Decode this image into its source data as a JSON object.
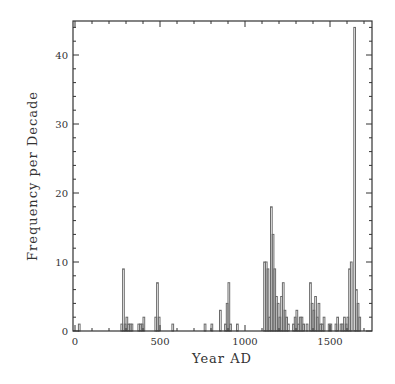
{
  "chart_data": {
    "type": "bar",
    "style": "step-histogram",
    "title": "",
    "xlabel": "Year AD",
    "ylabel": "Frequency per Decade",
    "xlim": [
      0,
      1700
    ],
    "ylim": [
      0,
      45
    ],
    "x_ticks": [
      0,
      500,
      1000,
      1500
    ],
    "y_ticks": [
      0,
      10,
      20,
      30,
      40
    ],
    "grid": false,
    "legend": null,
    "bin_width": 10,
    "bins": [
      {
        "x": 20,
        "y": 1
      },
      {
        "x": 270,
        "y": 1
      },
      {
        "x": 280,
        "y": 9
      },
      {
        "x": 290,
        "y": 1
      },
      {
        "x": 300,
        "y": 2
      },
      {
        "x": 310,
        "y": 1
      },
      {
        "x": 320,
        "y": 1
      },
      {
        "x": 330,
        "y": 1
      },
      {
        "x": 370,
        "y": 1
      },
      {
        "x": 380,
        "y": 1
      },
      {
        "x": 390,
        "y": 1
      },
      {
        "x": 400,
        "y": 2
      },
      {
        "x": 470,
        "y": 2
      },
      {
        "x": 480,
        "y": 7
      },
      {
        "x": 490,
        "y": 2
      },
      {
        "x": 570,
        "y": 1
      },
      {
        "x": 760,
        "y": 1
      },
      {
        "x": 800,
        "y": 1
      },
      {
        "x": 850,
        "y": 3
      },
      {
        "x": 880,
        "y": 1
      },
      {
        "x": 890,
        "y": 4
      },
      {
        "x": 900,
        "y": 7
      },
      {
        "x": 910,
        "y": 1
      },
      {
        "x": 950,
        "y": 1
      },
      {
        "x": 1110,
        "y": 10
      },
      {
        "x": 1120,
        "y": 10
      },
      {
        "x": 1130,
        "y": 9
      },
      {
        "x": 1140,
        "y": 2
      },
      {
        "x": 1150,
        "y": 18
      },
      {
        "x": 1160,
        "y": 14
      },
      {
        "x": 1170,
        "y": 9
      },
      {
        "x": 1180,
        "y": 5
      },
      {
        "x": 1190,
        "y": 4
      },
      {
        "x": 1200,
        "y": 2
      },
      {
        "x": 1210,
        "y": 5
      },
      {
        "x": 1220,
        "y": 7
      },
      {
        "x": 1230,
        "y": 3
      },
      {
        "x": 1240,
        "y": 2
      },
      {
        "x": 1250,
        "y": 1
      },
      {
        "x": 1280,
        "y": 1
      },
      {
        "x": 1290,
        "y": 2
      },
      {
        "x": 1300,
        "y": 3
      },
      {
        "x": 1310,
        "y": 1
      },
      {
        "x": 1320,
        "y": 2
      },
      {
        "x": 1330,
        "y": 2
      },
      {
        "x": 1340,
        "y": 1
      },
      {
        "x": 1360,
        "y": 1
      },
      {
        "x": 1380,
        "y": 7
      },
      {
        "x": 1390,
        "y": 4
      },
      {
        "x": 1400,
        "y": 3
      },
      {
        "x": 1410,
        "y": 5
      },
      {
        "x": 1420,
        "y": 2
      },
      {
        "x": 1430,
        "y": 4
      },
      {
        "x": 1440,
        "y": 1
      },
      {
        "x": 1450,
        "y": 1
      },
      {
        "x": 1460,
        "y": 2
      },
      {
        "x": 1490,
        "y": 1
      },
      {
        "x": 1500,
        "y": 1
      },
      {
        "x": 1530,
        "y": 1
      },
      {
        "x": 1540,
        "y": 2
      },
      {
        "x": 1560,
        "y": 1
      },
      {
        "x": 1570,
        "y": 1
      },
      {
        "x": 1580,
        "y": 2
      },
      {
        "x": 1590,
        "y": 1
      },
      {
        "x": 1600,
        "y": 2
      },
      {
        "x": 1610,
        "y": 9
      },
      {
        "x": 1620,
        "y": 10
      },
      {
        "x": 1640,
        "y": 44
      },
      {
        "x": 1650,
        "y": 6
      },
      {
        "x": 1660,
        "y": 4
      },
      {
        "x": 1670,
        "y": 2
      }
    ]
  },
  "labels": {
    "xlabel": "Year AD",
    "ylabel": "Frequency per Decade",
    "x_ticks": [
      "0",
      "500",
      "1000",
      "1500"
    ],
    "y_ticks": [
      "0",
      "10",
      "20",
      "30",
      "40"
    ]
  },
  "colors": {
    "line": "#6a6a6a",
    "axis": "#333333",
    "background": "#ffffff"
  }
}
